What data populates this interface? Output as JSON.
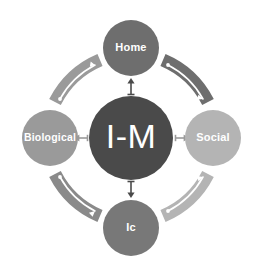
{
  "diagram": {
    "type": "cycle-hub-and-spoke",
    "background_color": "#ffffff",
    "hub": {
      "label": "I-M",
      "color": "#4a4a4a",
      "text_color": "#ffffff",
      "cx": 131,
      "cy": 138,
      "r": 42
    },
    "nodes": [
      {
        "id": "home",
        "label": "Home",
        "color": "#6e6e6e",
        "text_color": "#ffffff",
        "cx": 131,
        "cy": 48,
        "r": 28,
        "position": "top"
      },
      {
        "id": "social",
        "label": "Social",
        "color": "#b4b4b4",
        "text_color": "#ffffff",
        "cx": 213,
        "cy": 138,
        "r": 28,
        "position": "right"
      },
      {
        "id": "ic",
        "label": "Ic",
        "color": "#787878",
        "text_color": "#ffffff",
        "cx": 131,
        "cy": 228,
        "r": 28,
        "position": "bottom"
      },
      {
        "id": "biological",
        "label": "Biological",
        "color": "#9a9a9a",
        "text_color": "#ffffff",
        "cx": 50,
        "cy": 138,
        "r": 28,
        "position": "left"
      }
    ],
    "spokes": [
      {
        "id": "hub-to-home",
        "from": "hub",
        "to": "home",
        "direction": "up",
        "color": "#4a4a4a"
      },
      {
        "id": "hub-to-social",
        "from": "hub",
        "to": "social",
        "direction": "right",
        "color": "#9a9a9a"
      },
      {
        "id": "hub-to-ic",
        "from": "hub",
        "to": "ic",
        "direction": "down",
        "color": "#4a4a4a"
      },
      {
        "id": "hub-to-biological",
        "from": "hub",
        "to": "biological",
        "direction": "left",
        "color": "#9a9a9a"
      }
    ],
    "arcs": [
      {
        "id": "arc-biological-to-home",
        "from": "biological",
        "to": "home",
        "quadrant": "top-left",
        "color": "#9a9a9a",
        "arrow_color": "#ffffff"
      },
      {
        "id": "arc-home-to-social",
        "from": "home",
        "to": "social",
        "quadrant": "top-right",
        "color": "#6e6e6e",
        "arrow_color": "#ffffff"
      },
      {
        "id": "arc-ic-to-social",
        "from": "ic",
        "to": "social",
        "quadrant": "bottom-right",
        "color": "#b4b4b4",
        "arrow_color": "#ffffff"
      },
      {
        "id": "arc-biological-to-ic",
        "from": "biological",
        "to": "ic",
        "quadrant": "bottom-left",
        "color": "#8a8a8a",
        "arrow_color": "#ffffff"
      }
    ]
  }
}
